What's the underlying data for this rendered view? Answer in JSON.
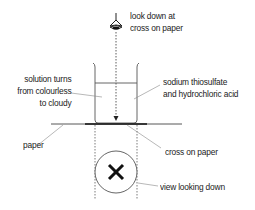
{
  "diagram": {
    "type": "experimental-setup",
    "colors": {
      "ink": "#222222",
      "leader": "#888888",
      "background": "#ffffff"
    },
    "labels": {
      "look_down": [
        "look down at",
        "cross on paper"
      ],
      "solution_turns": [
        "solution turns",
        "from colourless",
        "to cloudy"
      ],
      "reagents": [
        "sodium thiosulfate",
        "and hydrochloric acid"
      ],
      "paper": "paper",
      "cross_on_paper": "cross on paper",
      "view_looking_down": "view looking down"
    },
    "cross_symbol": "X",
    "icons": {
      "eye": "eye-icon"
    }
  }
}
